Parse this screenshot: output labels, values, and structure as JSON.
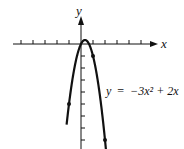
{
  "chart_data": {
    "type": "line",
    "title": "",
    "xlabel": "x",
    "ylabel": "y",
    "equation": "y = −3x² + 2x",
    "function": "-3*x^2 + 2*x",
    "vertex": [
      0.3333,
      0.3333
    ],
    "x_ticks": [
      -5,
      -4,
      -3,
      -2,
      -1,
      1,
      2,
      3,
      4,
      5
    ],
    "y_ticks": [
      -1,
      -2,
      -3,
      -4,
      -5,
      -6,
      -7,
      -8
    ],
    "marked_points": [
      {
        "x": 0,
        "y": 0
      },
      {
        "x": 1,
        "y": -1
      },
      {
        "x": -1,
        "y": -5
      },
      {
        "x": 2,
        "y": -8
      }
    ],
    "xlim": [
      -5.5,
      5.5
    ],
    "ylim": [
      -8.8,
      3.5
    ],
    "grid": false,
    "legend": null
  },
  "labels": {
    "x_axis": "x",
    "y_axis": "y",
    "equation_lhs": "y",
    "equation_eq": "=",
    "equation_rhs": "−3x² + 2x"
  },
  "colors": {
    "ink": "#111111",
    "background": "#ffffff"
  }
}
